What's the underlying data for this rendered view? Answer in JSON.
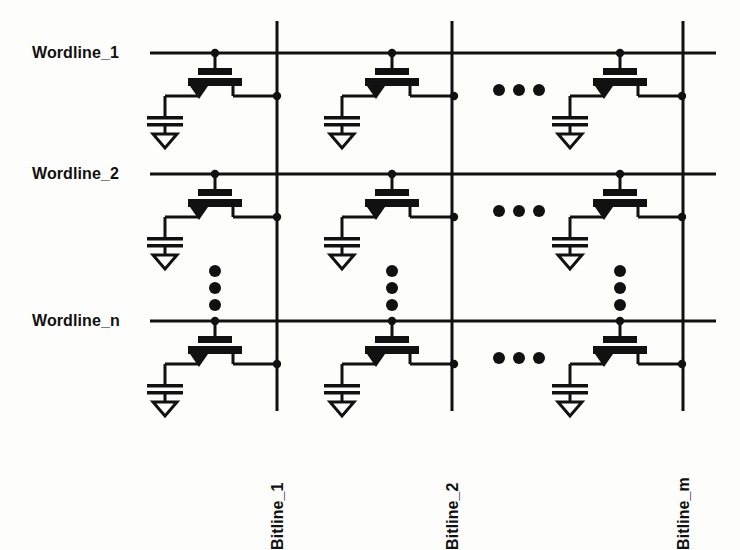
{
  "diagram": {
    "type": "circuit-schematic",
    "line_color": "#111111",
    "background_color": "#fdfdfb"
  },
  "wordlines": [
    {
      "label": "Wordline_1",
      "y": 53
    },
    {
      "label": "Wordline_2",
      "y": 174
    },
    {
      "label": "Wordline_n",
      "y": 321
    }
  ],
  "bitlines": [
    {
      "label": "Bitline_1",
      "x": 277
    },
    {
      "label": "Bitline_2",
      "x": 452
    },
    {
      "label": "Bitline_m",
      "x": 683
    }
  ],
  "ellipses": {
    "column_gap_symbol": "•••",
    "row_gap_symbol": "⋮",
    "column_gap_x": 510,
    "column_gap_rows": [
      88,
      209,
      356
    ],
    "row_gap_columns": [
      215,
      392,
      620
    ],
    "row_gap_y": [
      277,
      277
    ]
  },
  "cell": {
    "name": "1T1C DRAM cell",
    "components": [
      "access-transistor",
      "storage-capacitor",
      "ground"
    ]
  }
}
